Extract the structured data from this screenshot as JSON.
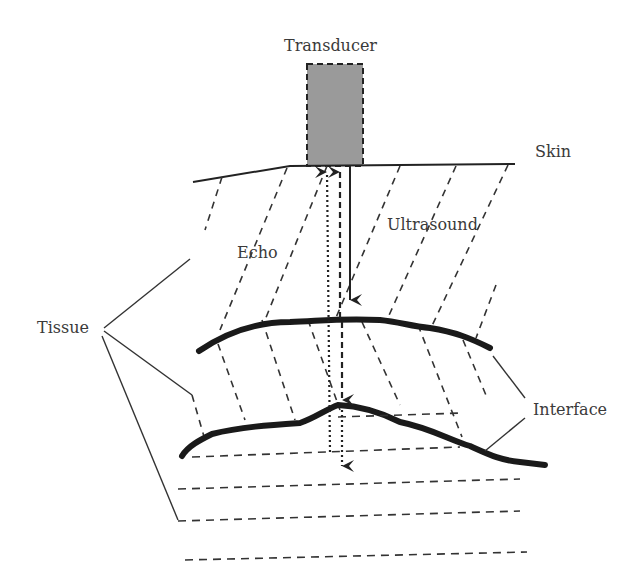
{
  "diagram": {
    "labels": {
      "transducer": "Transducer",
      "skin": "Skin",
      "echo": "Echo",
      "ultrasound": "Ultrasound",
      "tissue": "Tissue",
      "interface": "Interface"
    },
    "colors": {
      "transducer_fill": "#9a9a9a",
      "line": "#222222",
      "interface_line": "#1a1a1a",
      "text": "#3a3a3a"
    }
  }
}
